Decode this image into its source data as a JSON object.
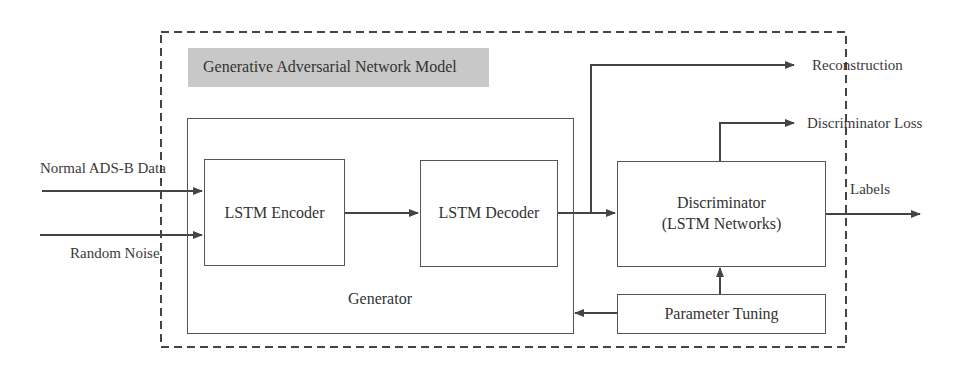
{
  "diagram": {
    "title": "Generative Adversarial Network Model",
    "inputs": [
      {
        "label": "Normal ADS-B Data"
      },
      {
        "label": "Random Noise"
      }
    ],
    "generator": {
      "label": "Generator",
      "encoder": "LSTM Encoder",
      "decoder": "LSTM Decoder"
    },
    "discriminator": {
      "line1": "Discriminator",
      "line2": "(LSTM Networks)"
    },
    "parameter_tuning": "Parameter Tuning",
    "outputs": {
      "reconstruction": "Reconstruction",
      "discriminator_loss": "Discriminator Loss",
      "labels": "Labels"
    },
    "colors": {
      "line": "#444444",
      "title_bg": "#c8c8c8",
      "dash": "#444444"
    }
  }
}
